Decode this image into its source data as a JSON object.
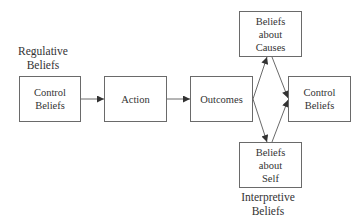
{
  "diagram": {
    "groups": {
      "regulative": "Regulative\nBeliefs",
      "interpretive": "Interpretive\nBeliefs"
    },
    "nodes": {
      "control_beliefs_left": "Control\nBeliefs",
      "action": "Action",
      "outcomes": "Outcomes",
      "beliefs_about_causes": "Beliefs\nabout\nCauses",
      "beliefs_about_self": "Beliefs\nabout\nSelf",
      "control_beliefs_right": "Control\nBeliefs"
    },
    "edges": [
      {
        "from": "Control Beliefs",
        "to": "Action"
      },
      {
        "from": "Action",
        "to": "Outcomes"
      },
      {
        "from": "Outcomes",
        "to": "Beliefs about Causes"
      },
      {
        "from": "Outcomes",
        "to": "Beliefs about Self"
      },
      {
        "from": "Beliefs about Causes",
        "to": "Control Beliefs"
      },
      {
        "from": "Beliefs about Self",
        "to": "Control Beliefs"
      }
    ],
    "colors": {
      "stroke": "#6a6a6a",
      "text": "#333333",
      "background": "#ffffff"
    }
  }
}
